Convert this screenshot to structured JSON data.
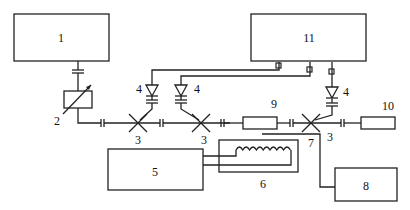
{
  "diagram": {
    "type": "schematic block diagram",
    "blocks": [
      {
        "id": "1",
        "label": "1"
      },
      {
        "id": "5",
        "label": "5"
      },
      {
        "id": "6",
        "label": "6"
      },
      {
        "id": "8",
        "label": "8"
      },
      {
        "id": "9",
        "label": "9"
      },
      {
        "id": "10",
        "label": "10"
      },
      {
        "id": "11",
        "label": "11"
      }
    ],
    "labels": {
      "attenuator": "2",
      "coupler_a": "3",
      "coupler_b": "3",
      "coupler_c": "3",
      "detector_a": "4",
      "detector_b": "4",
      "detector_c": "4",
      "probe": "7"
    }
  }
}
